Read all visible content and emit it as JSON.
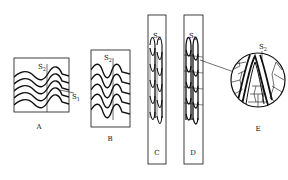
{
  "diagram": {
    "type": "stages of crenulation cleavage development",
    "panels": [
      {
        "id": "A",
        "label": "A",
        "surface_labels": [
          "S2",
          "S1"
        ]
      },
      {
        "id": "B",
        "label": "B",
        "surface_labels": [
          "S2"
        ]
      },
      {
        "id": "C",
        "label": "C",
        "surface_labels": [
          "S2"
        ]
      },
      {
        "id": "D",
        "label": "D",
        "surface_labels": [
          "S2"
        ]
      },
      {
        "id": "E",
        "label": "E",
        "surface_labels": [
          "S2"
        ],
        "note": "magnified circular inset linked to panel D"
      }
    ],
    "s_main": "S",
    "sub2": "2",
    "sub1": "1",
    "colors": {
      "line": "#111111",
      "background": "#ffffff"
    }
  }
}
